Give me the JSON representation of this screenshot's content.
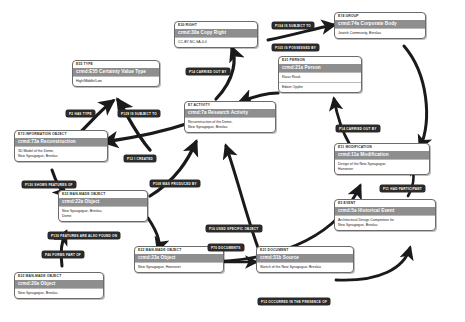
{
  "diagram": {
    "nodes": [
      {
        "id": "e55-type",
        "class_label": "E55 TYPE",
        "title": "crmd:E55 Certainty Value Type",
        "body": [
          "High/Middle/Low"
        ]
      },
      {
        "id": "e30-right",
        "class_label": "E30 RIGHT",
        "title": "crmd:30a Copy Right",
        "body": [
          "CC-BY-NC-SA-4.0"
        ]
      },
      {
        "id": "e74-group",
        "class_label": "E74 GROUP",
        "title": "crmd:74a Corporate Body",
        "body": [
          "Jewish Community, Breslau"
        ]
      },
      {
        "id": "e21-person",
        "class_label": "E21 PERSON",
        "title": "crmd:21a Person",
        "body": [
          "Klaus Rivak",
          "Edwin Oppler"
        ]
      },
      {
        "id": "e7-activity",
        "class_label": "E7 ACTIVITY",
        "title": "crmd:7a Research Activity",
        "body": [
          "Reconstruction of the Dome,",
          "New Synagogue, Breslau"
        ]
      },
      {
        "id": "e73-info",
        "class_label": "E73 INFORMATION OBJECT",
        "title": "crmd:73a Reconstruction",
        "body": [
          "3D Model of the Dome,",
          "New Synagogue, Breslau"
        ]
      },
      {
        "id": "e11-mod",
        "class_label": "E11 MODIFICATION",
        "title": "crmd:11a Modification",
        "body": [
          "Design of the New Synagogue,",
          "Hannover"
        ]
      },
      {
        "id": "e5-event",
        "class_label": "E5 EVENT",
        "title": "crmd:5a Historical Event",
        "body": [
          "Architectural Design Competition for",
          "New Synagogue, Breslau"
        ]
      },
      {
        "id": "e22-dome",
        "class_label": "E22 MAN-MADE OBJECT",
        "title": "crmd:22a Object",
        "body": [
          "New Synagogue, Breslau,",
          "Dome"
        ]
      },
      {
        "id": "e22-hannover",
        "class_label": "E22 MAN-MADE OBJECT",
        "title": "crmd:23a Object",
        "body": [
          "New Synagogue, Hannover"
        ]
      },
      {
        "id": "e22-breslau",
        "class_label": "E22 MAN-MADE OBJECT",
        "title": "crmd:20a Object",
        "body": [
          "New Synagogue, Breslau"
        ]
      },
      {
        "id": "e31-doc",
        "class_label": "E31 DOCUMENT",
        "title": "crmd:31b Source",
        "body": [
          "Sketch of the New Synagogue, Breslau"
        ]
      }
    ],
    "relations": [
      {
        "id": "r-p2-has-type",
        "label": "P2 HAS TYPE"
      },
      {
        "id": "r-p129-is-subject-to",
        "label": "P129 IS SUBJECT TO"
      },
      {
        "id": "r-p104-is-subject-to",
        "label": "P104 IS SUBJECT TO"
      },
      {
        "id": "r-p105-is-possessed",
        "label": "P105 IS POSSESSED BY"
      },
      {
        "id": "r-p14-carried-out-1",
        "label": "P14 CARRIED OUT BY"
      },
      {
        "id": "r-p14-carried-out-2",
        "label": "P14 CARRIED OUT BY"
      },
      {
        "id": "r-p12-created",
        "label": "P12 I CREATED"
      },
      {
        "id": "r-p11-had-participant",
        "label": "P11 HAD PARTICIPANT"
      },
      {
        "id": "r-p130-shows-features",
        "label": "P130 SHOWS FEATURES OF"
      },
      {
        "id": "r-p108-was-produced",
        "label": "P108 WAS PRODUCED BY"
      },
      {
        "id": "r-p130-also-found",
        "label": "P130 FEATURES ARE ALSO FOUND ON"
      },
      {
        "id": "r-p16-used-specific",
        "label": "P16 USED SPECIFIC OBJECT"
      },
      {
        "id": "r-p70-forms-part",
        "label": "P46 FORMS PART OF"
      },
      {
        "id": "r-p70-documents",
        "label": "P70 DOCUMENTS"
      },
      {
        "id": "r-p12-presence",
        "label": "P12 OCCURRED IN THE PRESENCE OF"
      }
    ]
  }
}
